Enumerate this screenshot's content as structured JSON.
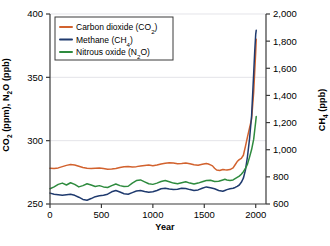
{
  "chart_data": {
    "type": "line",
    "title": "",
    "xlabel": "Year",
    "ylabel": "CO2 (ppm), N2O (ppb)",
    "ylabel_right": "CH4 (ppb)",
    "xlim": [
      0,
      2100
    ],
    "ylim": [
      250,
      400
    ],
    "ylim_right": [
      600,
      2000
    ],
    "grid": true,
    "grid_orientation": "horizontal",
    "legend_position": "top-left",
    "xticks": [
      "0",
      "500",
      "1000",
      "1500",
      "2000"
    ],
    "xtick_values": [
      0,
      500,
      1000,
      1500,
      2000
    ],
    "yticks_left": [
      "250",
      "300",
      "350",
      "400"
    ],
    "ytick_values_left": [
      250,
      300,
      350,
      400
    ],
    "yticks_right": [
      "600",
      "800",
      "1,000",
      "1,200",
      "1,400",
      "1,600",
      "1,800",
      "2,000"
    ],
    "ytick_values_right": [
      600,
      800,
      1000,
      1200,
      1400,
      1600,
      1800,
      2000
    ],
    "series": [
      {
        "name": "Carbon dioxide (CO2)",
        "legend_label": "Carbon dioxide (CO₂)",
        "color": "#D2622E",
        "axis": "left",
        "units": "ppm",
        "x": [
          0,
          40,
          80,
          120,
          160,
          200,
          240,
          280,
          320,
          360,
          400,
          440,
          480,
          520,
          560,
          600,
          640,
          680,
          720,
          760,
          800,
          840,
          880,
          920,
          960,
          1000,
          1040,
          1080,
          1120,
          1160,
          1200,
          1240,
          1280,
          1320,
          1360,
          1400,
          1440,
          1480,
          1520,
          1540,
          1560,
          1580,
          1600,
          1620,
          1650,
          1680,
          1700,
          1720,
          1750,
          1780,
          1800,
          1820,
          1840,
          1860,
          1880,
          1900,
          1920,
          1940,
          1960,
          1980,
          1990,
          2000,
          2005
        ],
        "y": [
          278.2,
          278.0,
          278.5,
          279.5,
          280.5,
          281.2,
          280.8,
          279.8,
          278.8,
          278.2,
          278.0,
          278.3,
          278.5,
          278.0,
          277.5,
          277.6,
          278.0,
          278.8,
          279.4,
          279.6,
          279.3,
          279.5,
          280.0,
          280.4,
          280.7,
          280.2,
          280.8,
          281.6,
          282.2,
          282.6,
          282.3,
          281.8,
          282.0,
          282.3,
          281.7,
          281.0,
          280.6,
          281.3,
          282.0,
          281.6,
          280.9,
          280.1,
          278.2,
          276.8,
          276.5,
          277.3,
          277.0,
          276.8,
          277.2,
          278.5,
          281.0,
          283.5,
          285.0,
          286.0,
          288.5,
          295.5,
          303.0,
          310.0,
          317.0,
          338.0,
          354.0,
          370.0,
          380.0
        ]
      },
      {
        "name": "Methane (CH4)",
        "legend_label": "Methane (CH₄)",
        "color": "#1F3A6E",
        "axis": "right",
        "units": "ppb",
        "x": [
          0,
          40,
          80,
          120,
          160,
          200,
          240,
          280,
          320,
          360,
          400,
          440,
          480,
          520,
          560,
          600,
          640,
          680,
          720,
          760,
          800,
          840,
          880,
          920,
          960,
          1000,
          1040,
          1080,
          1120,
          1160,
          1200,
          1240,
          1280,
          1320,
          1360,
          1400,
          1440,
          1480,
          1520,
          1560,
          1600,
          1640,
          1680,
          1700,
          1720,
          1750,
          1780,
          1800,
          1820,
          1840,
          1860,
          1880,
          1900,
          1920,
          1940,
          1960,
          1980,
          1990,
          2000,
          2005
        ],
        "y": [
          680,
          672,
          668,
          664,
          668,
          672,
          664,
          650,
          634,
          628,
          640,
          654,
          660,
          664,
          672,
          690,
          700,
          688,
          676,
          672,
          684,
          696,
          700,
          692,
          686,
          690,
          700,
          712,
          716,
          710,
          706,
          708,
          716,
          714,
          706,
          700,
          704,
          716,
          726,
          720,
          712,
          700,
          694,
          700,
          706,
          712,
          716,
          722,
          730,
          740,
          760,
          790,
          850,
          950,
          1080,
          1250,
          1560,
          1720,
          1850,
          1880
        ]
      },
      {
        "name": "Nitrous oxide (N2O)",
        "legend_label": "Nitrous oxide (N₂O)",
        "color": "#2E8B3E",
        "axis": "left",
        "units": "ppb",
        "x": [
          0,
          40,
          80,
          120,
          160,
          200,
          240,
          280,
          320,
          360,
          400,
          440,
          480,
          520,
          560,
          600,
          640,
          680,
          720,
          760,
          800,
          840,
          880,
          920,
          960,
          1000,
          1040,
          1080,
          1120,
          1160,
          1200,
          1240,
          1280,
          1320,
          1360,
          1400,
          1440,
          1480,
          1520,
          1560,
          1600,
          1640,
          1680,
          1700,
          1720,
          1750,
          1780,
          1800,
          1820,
          1840,
          1860,
          1880,
          1900,
          1920,
          1940,
          1960,
          1980,
          1990,
          2000,
          2005
        ],
        "y": [
          262.0,
          263.5,
          265.5,
          266.5,
          265.0,
          266.8,
          265.5,
          263.5,
          264.5,
          266.0,
          265.0,
          263.8,
          264.5,
          263.5,
          263.0,
          264.5,
          265.8,
          264.5,
          263.8,
          264.0,
          266.5,
          268.5,
          269.0,
          267.5,
          266.0,
          265.5,
          266.5,
          267.8,
          268.5,
          267.5,
          266.5,
          266.0,
          266.8,
          267.5,
          266.5,
          265.8,
          266.5,
          267.5,
          268.5,
          268.8,
          267.8,
          268.0,
          269.0,
          269.5,
          269.0,
          268.5,
          269.0,
          270.0,
          271.0,
          272.0,
          273.5,
          275.5,
          278.0,
          281.5,
          287.0,
          293.0,
          301.0,
          308.0,
          315.0,
          319.0
        ]
      }
    ]
  },
  "legend": {
    "entries": [
      {
        "label": "Carbon dioxide (CO₂)",
        "color": "#D2622E"
      },
      {
        "label": "Methane (CH₄)",
        "color": "#1F3A6E"
      },
      {
        "label": "Nitrous oxide (N₂O)",
        "color": "#2E8B3E"
      }
    ]
  },
  "axes": {
    "x_title": "Year",
    "y_title_left_parts": {
      "a": "CO",
      "a_sub": "2",
      "b": " (ppm), N",
      "b_sub": "2",
      "c": "O (ppb)"
    },
    "y_title_right_parts": {
      "a": "CH",
      "a_sub": "4",
      "b": " (ppb)"
    }
  }
}
